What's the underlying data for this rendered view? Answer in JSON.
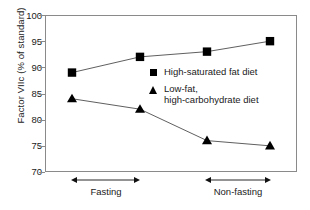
{
  "chart_data": {
    "type": "line",
    "title": "",
    "xlabel": "",
    "ylabel": "Factor VIIc (% of standard)",
    "ylim": [
      70,
      100
    ],
    "yticks": [
      70,
      75,
      80,
      85,
      90,
      95,
      100
    ],
    "grid": false,
    "legend_position": "inside-center",
    "x": [
      1,
      2,
      3,
      4
    ],
    "categories": [
      "Fasting 1",
      "Fasting 2",
      "Non-fasting 1",
      "Non-fasting 2"
    ],
    "series": [
      {
        "name": "High-saturated fat diet",
        "marker": "square",
        "values": [
          89,
          92,
          93,
          95
        ]
      },
      {
        "name": "Low-fat, high-carbohydrate diet",
        "marker": "triangle",
        "values": [
          84,
          82,
          76,
          75
        ]
      }
    ],
    "annotations": [
      {
        "label": "Fasting",
        "span_x": [
          1,
          2
        ]
      },
      {
        "label": "Non-fasting",
        "span_x": [
          3,
          4
        ]
      }
    ]
  },
  "axis": {
    "y_title": "Factor VIIc (% of standard)",
    "y_tick_labels": [
      "100",
      "95",
      "90",
      "85",
      "80",
      "75",
      "70"
    ]
  },
  "legend": {
    "entries": [
      {
        "marker": "square-marker",
        "line1": "High-saturated fat diet",
        "line2": ""
      },
      {
        "marker": "triangle-marker",
        "line1": "Low-fat,",
        "line2": "high-carbohydrate diet"
      }
    ]
  },
  "groups": [
    {
      "label": "Fasting"
    },
    {
      "label": "Non-fasting"
    }
  ],
  "colors": {
    "marker": "#000000",
    "line": "#4d4d4d",
    "frame": "#8a8a8a",
    "text": "#1a1a1a",
    "background": "#ffffff"
  }
}
